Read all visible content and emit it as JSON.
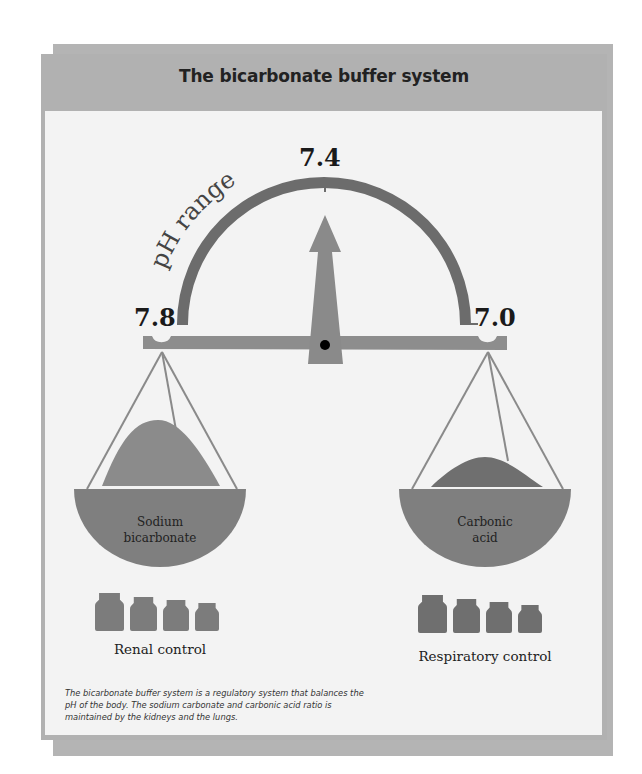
{
  "title": "The bicarbonate buffer system",
  "gauge": {
    "label": "pH range",
    "top_value": "7.4",
    "left_value": "7.8",
    "right_value": "7.0",
    "pointer_value": 7.4,
    "range": [
      7.0,
      7.8
    ]
  },
  "left_pan": {
    "label_line1": "Sodium",
    "label_line2": "bicarbonate",
    "weights_count": 4,
    "control_label": "Renal control"
  },
  "right_pan": {
    "label_line1": "Carbonic",
    "label_line2": "acid",
    "weights_count": 4,
    "control_label": "Respiratory control"
  },
  "caption": "The bicarbonate buffer system is a regulatory system that balances the pH of the body. The sodium carbonate and carbonic acid ratio is maintained by the kidneys and the lungs.",
  "colors": {
    "frame": "#b1b1b1",
    "panel": "#f3f3f3",
    "arc": "#6e6e6e",
    "beam": "#8f8f8f",
    "pointer": "#8c8c8c",
    "pan": "#7f7f7f",
    "weights": "#7a7a7a"
  }
}
